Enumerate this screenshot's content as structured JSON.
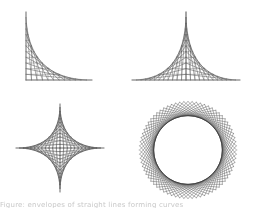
{
  "figure": {
    "panels": [
      {
        "id": "corner-envelope",
        "shape": "parabola-envelope-quadrant",
        "lines": 12,
        "ox": 26,
        "oy": 80,
        "w": 66,
        "h": 68
      },
      {
        "id": "peak-envelope",
        "shape": "double-quadrant-envelope",
        "lines": 12,
        "cx": 186,
        "oy": 80,
        "w": 54,
        "h": 68
      },
      {
        "id": "astroid-envelope",
        "shape": "astroid",
        "lines": 12,
        "cx": 60,
        "cy": 148,
        "r": 44
      },
      {
        "id": "circle-envelope",
        "shape": "rotated-squares-circle",
        "squares": 18,
        "cx": 188,
        "cy": 150,
        "r": 44
      }
    ],
    "stroke_color": "#555555",
    "axis_color": "#777777"
  },
  "caption": {
    "text": "Figure: envelopes of straight lines forming curves"
  }
}
